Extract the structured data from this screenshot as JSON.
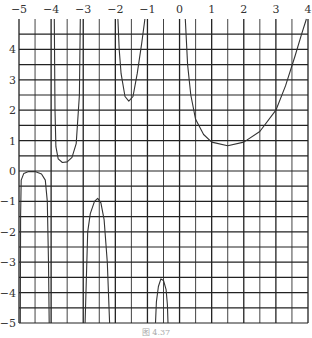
{
  "chart_data": {
    "type": "line",
    "title": "",
    "xlabel": "",
    "ylabel": "",
    "xlim": [
      -5,
      4
    ],
    "ylim": [
      -5,
      5
    ],
    "grid": true,
    "grid_step": 0.5,
    "x_ticks": [
      -5,
      -4,
      -3,
      -2,
      -1,
      0,
      1,
      2,
      3,
      4
    ],
    "x_tick_labels": [
      "−5",
      "−4",
      "−3",
      "−2",
      "−1",
      "0",
      "1",
      "2",
      "3",
      "4"
    ],
    "y_ticks": [
      4,
      3,
      2,
      1,
      0,
      -1,
      -2,
      -3,
      -4,
      -5
    ],
    "y_tick_labels": [
      "4",
      "3",
      "2",
      "1",
      "0",
      "−1",
      "−2",
      "−3",
      "−4",
      "−5"
    ],
    "legend": [],
    "series": [
      {
        "name": "branch-1 (x in [-5,-4])",
        "points": [
          [
            -4.96,
            -5
          ],
          [
            -4.95,
            -1.5
          ],
          [
            -4.93,
            -0.3
          ],
          [
            -4.85,
            -0.08
          ],
          [
            -4.7,
            -0.02
          ],
          [
            -4.5,
            -0.02
          ],
          [
            -4.3,
            -0.1
          ],
          [
            -4.18,
            -0.3
          ],
          [
            -4.12,
            -1.0
          ],
          [
            -4.08,
            -3
          ],
          [
            -4.06,
            -5
          ]
        ]
      },
      {
        "name": "branch-2 (x in [-4,-3])",
        "points": [
          [
            -3.9,
            5
          ],
          [
            -3.88,
            2
          ],
          [
            -3.85,
            0.8
          ],
          [
            -3.78,
            0.4
          ],
          [
            -3.65,
            0.28
          ],
          [
            -3.5,
            0.3
          ],
          [
            -3.35,
            0.45
          ],
          [
            -3.22,
            0.9
          ],
          [
            -3.12,
            2.5
          ],
          [
            -3.09,
            5
          ]
        ]
      },
      {
        "name": "branch-3 (x in [-3,-2])",
        "points": [
          [
            -2.94,
            -5
          ],
          [
            -2.86,
            -2
          ],
          [
            -2.78,
            -1.4
          ],
          [
            -2.65,
            -1.0
          ],
          [
            -2.55,
            -0.9
          ],
          [
            -2.45,
            -1.05
          ],
          [
            -2.35,
            -1.6
          ],
          [
            -2.25,
            -3
          ],
          [
            -2.18,
            -5
          ]
        ]
      },
      {
        "name": "branch-4 (x in [-2,-1])",
        "points": [
          [
            -1.92,
            5
          ],
          [
            -1.88,
            4
          ],
          [
            -1.82,
            3.2
          ],
          [
            -1.7,
            2.45
          ],
          [
            -1.58,
            2.3
          ],
          [
            -1.45,
            2.45
          ],
          [
            -1.32,
            3.2
          ],
          [
            -1.18,
            4.2
          ],
          [
            -1.08,
            5
          ]
        ]
      },
      {
        "name": "branch-5 (x in [-1,0])",
        "points": [
          [
            -0.75,
            -5
          ],
          [
            -0.72,
            -4.3
          ],
          [
            -0.66,
            -3.8
          ],
          [
            -0.58,
            -3.55
          ],
          [
            -0.5,
            -3.6
          ],
          [
            -0.42,
            -3.9
          ],
          [
            -0.38,
            -4.4
          ],
          [
            -0.36,
            -5
          ]
        ]
      },
      {
        "name": "branch-6 (x in [0,4])",
        "points": [
          [
            0.18,
            5
          ],
          [
            0.25,
            3.5
          ],
          [
            0.35,
            2.5
          ],
          [
            0.5,
            1.7
          ],
          [
            0.75,
            1.2
          ],
          [
            1.0,
            0.95
          ],
          [
            1.5,
            0.83
          ],
          [
            2.0,
            0.95
          ],
          [
            2.5,
            1.3
          ],
          [
            3.0,
            2.0
          ],
          [
            3.3,
            2.8
          ],
          [
            3.6,
            3.8
          ],
          [
            3.8,
            4.5
          ],
          [
            3.95,
            5
          ]
        ]
      }
    ]
  },
  "caption": "图 4.37"
}
